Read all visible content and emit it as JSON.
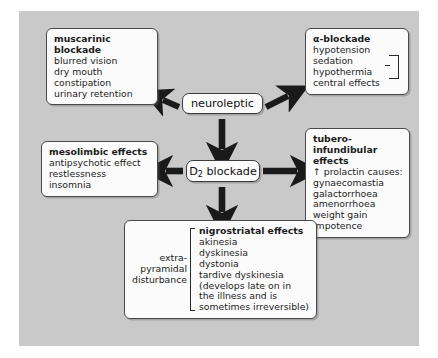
{
  "diagram": {
    "panel_color": "#c9c9c9",
    "box_fill": "#fbfbfb",
    "box_border": "#4a4a4a",
    "arrow_color": "#1a1a1a"
  },
  "central": {
    "neuroleptic_label": "neuroleptic",
    "d2_label": "D",
    "d2_subscript": "2",
    "d2_label_tail": " blockade"
  },
  "muscarinic": {
    "header": "muscarinic blockade",
    "items": [
      "blurred vision",
      "dry mouth",
      "constipation",
      "urinary retention"
    ]
  },
  "alpha": {
    "header": "α-blockade",
    "items": [
      "hypotension",
      "sedation",
      "hypothermia",
      "central effects"
    ],
    "bracket_note": "sedation and hypothermia grouped as central effects"
  },
  "mesolimbic": {
    "header": "mesolimbic effects",
    "items": [
      "antipsychotic effect",
      "restlessness",
      "insomnia"
    ]
  },
  "tubero": {
    "header_line1": "tubero-infundibular",
    "header_line2": "effects",
    "prolactin_arrow": "↑",
    "prolactin_text": "prolactin causes:",
    "items": [
      "gynaecomastia",
      "galactorrhoea",
      "amenorrhoea",
      "weight gain",
      "impotence"
    ]
  },
  "nigrostriatal": {
    "header": "nigrostriatal effects",
    "left_label_lines": [
      "extra-",
      "pyramidal",
      "disturbance"
    ],
    "items": [
      "akinesia",
      "dyskinesia",
      "dystonia",
      "tardive dyskinesia",
      "(develops late on in",
      "the illness and is",
      "sometimes irreversible)"
    ]
  },
  "arrows": {
    "to_muscarinic": "neuroleptic → muscarinic blockade (up-left)",
    "to_alpha": "neuroleptic → α-blockade (up-right)",
    "to_d2": "neuroleptic → D2 blockade (down)",
    "to_mesolimbic": "D2 blockade → mesolimbic effects (left)",
    "to_tubero": "D2 blockade → tubero-infundibular effects (right)",
    "to_nigrostriatal": "D2 blockade → nigrostriatal effects (down)"
  }
}
